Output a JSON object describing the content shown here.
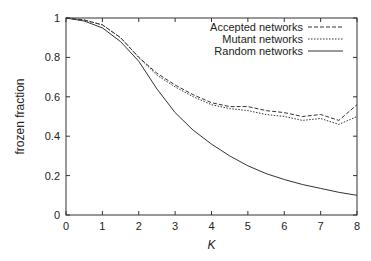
{
  "chart_data": {
    "type": "line",
    "title": "",
    "xlabel": "K",
    "ylabel": "frozen fraction",
    "xlim": [
      0,
      8
    ],
    "ylim": [
      0,
      1
    ],
    "xticks": [
      "0",
      "1",
      "2",
      "3",
      "4",
      "5",
      "6",
      "7",
      "8"
    ],
    "yticks": [
      "0",
      "0.2",
      "0.4",
      "0.6",
      "0.8",
      "1"
    ],
    "grid": false,
    "legend_position": "top-right",
    "x": [
      0,
      0.5,
      1,
      1.5,
      2,
      2.5,
      3,
      3.5,
      4,
      4.5,
      5,
      5.5,
      6,
      6.5,
      7,
      7.5,
      8
    ],
    "series": [
      {
        "name": "Accepted networks",
        "style": "dashed",
        "values": [
          1.0,
          0.99,
          0.965,
          0.9,
          0.8,
          0.72,
          0.66,
          0.61,
          0.57,
          0.55,
          0.55,
          0.53,
          0.52,
          0.5,
          0.51,
          0.48,
          0.56
        ]
      },
      {
        "name": "Mutant networks",
        "style": "dotted",
        "values": [
          1.0,
          0.99,
          0.965,
          0.9,
          0.8,
          0.71,
          0.65,
          0.6,
          0.56,
          0.54,
          0.53,
          0.51,
          0.5,
          0.48,
          0.49,
          0.46,
          0.5
        ]
      },
      {
        "name": "Random networks",
        "style": "solid",
        "values": [
          1.0,
          0.985,
          0.95,
          0.88,
          0.78,
          0.64,
          0.52,
          0.43,
          0.36,
          0.3,
          0.25,
          0.21,
          0.18,
          0.155,
          0.135,
          0.115,
          0.1
        ]
      }
    ]
  }
}
